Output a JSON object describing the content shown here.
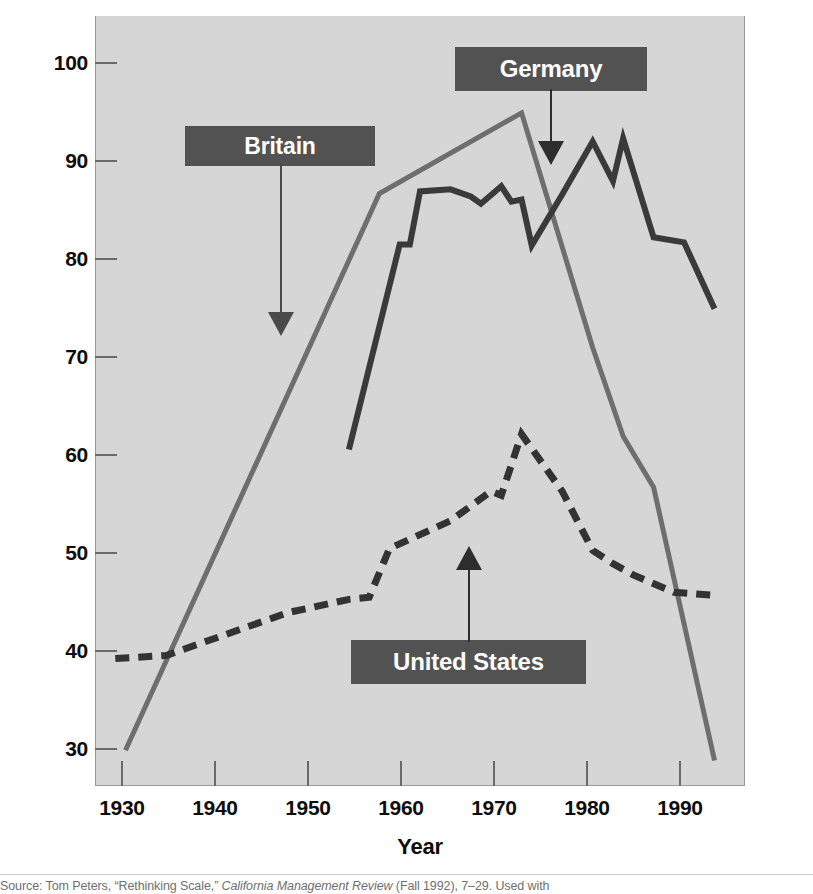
{
  "chart_data": {
    "type": "line",
    "title": "",
    "xlabel": "Year",
    "ylabel": "Number of employees per establishment (standardized)",
    "xlim": [
      1928,
      1992
    ],
    "ylim": [
      27.5,
      103
    ],
    "grid": false,
    "legend": "in-plot callout boxes with arrows",
    "xticks": [
      1930,
      1940,
      1950,
      1960,
      1970,
      1980,
      1990
    ],
    "yticks": [
      30,
      40,
      50,
      60,
      70,
      80,
      90,
      100
    ],
    "series": [
      {
        "name": "Britain",
        "style": "solid",
        "color": "#6e6e6e",
        "points": [
          [
            1931,
            31.0
          ],
          [
            1956,
            85.6
          ],
          [
            1970,
            93.5
          ],
          [
            1977,
            70.5
          ],
          [
            1980,
            61.8
          ],
          [
            1983,
            56.8
          ],
          [
            1989,
            30.0
          ]
        ]
      },
      {
        "name": "Germany",
        "style": "solid",
        "color": "#3a3a3a",
        "points": [
          [
            1953,
            60.5
          ],
          [
            1958,
            80.6
          ],
          [
            1959,
            80.6
          ],
          [
            1960,
            85.8
          ],
          [
            1963,
            86.0
          ],
          [
            1965,
            85.3
          ],
          [
            1966,
            84.6
          ],
          [
            1968,
            86.3
          ],
          [
            1969,
            84.8
          ],
          [
            1970,
            85.0
          ],
          [
            1971,
            80.5
          ],
          [
            1974,
            85.5
          ],
          [
            1977,
            90.7
          ],
          [
            1979,
            86.8
          ],
          [
            1980,
            91.0
          ],
          [
            1983,
            81.3
          ],
          [
            1986,
            80.8
          ],
          [
            1989,
            74.3
          ]
        ]
      },
      {
        "name": "United States",
        "style": "dashed",
        "color": "#333333",
        "points": [
          [
            1930,
            40.0
          ],
          [
            1935,
            40.3
          ],
          [
            1947,
            44.5
          ],
          [
            1953,
            45.8
          ],
          [
            1955,
            46.0
          ],
          [
            1957,
            50.8
          ],
          [
            1963,
            53.5
          ],
          [
            1967,
            56.4
          ],
          [
            1968,
            56.0
          ],
          [
            1970,
            62.0
          ],
          [
            1974,
            56.4
          ],
          [
            1977,
            50.6
          ],
          [
            1979,
            49.3
          ],
          [
            1981,
            48.2
          ],
          [
            1985,
            46.5
          ],
          [
            1989,
            46.2
          ]
        ]
      }
    ],
    "annotations": [
      {
        "label": "Britain",
        "box": {
          "x": 185,
          "y": 126,
          "w": 190,
          "h": 40
        },
        "arrow": {
          "from_x": 280,
          "from_y": 166,
          "to_x": 280,
          "to_y": 330
        },
        "points_at_series": "Britain"
      },
      {
        "label": "Germany",
        "box": {
          "x": 455,
          "y": 47,
          "w": 192,
          "h": 44
        },
        "arrow": {
          "from_x": 550,
          "from_y": 91,
          "to_x": 550,
          "to_y": 160
        },
        "points_at_series": "Germany"
      },
      {
        "label": "United States",
        "box": {
          "x": 351,
          "y": 640,
          "w": 235,
          "h": 44
        },
        "arrow": {
          "from_x": 469,
          "from_y": 640,
          "to_x": 469,
          "to_y": 548
        },
        "points_at_series": "United States"
      }
    ],
    "colors": {
      "plot_background": "#d6d6d6",
      "page_background": "#ffffff",
      "britain": "#6e6e6e",
      "germany": "#3a3a3a",
      "united_states": "#333333",
      "callout_box": "#525252",
      "callout_text": "#ffffff",
      "axis_text": "#0d0d0d"
    }
  },
  "axes": {
    "x_title": "Year",
    "y_title": "Number of employees per establishment (standardized)",
    "x_tick_labels": [
      "1930",
      "1940",
      "1950",
      "1960",
      "1970",
      "1980",
      "1990"
    ],
    "y_tick_labels": [
      "100",
      "90",
      "80",
      "70",
      "60",
      "50",
      "40",
      "30"
    ]
  },
  "callouts": {
    "britain": "Britain",
    "germany": "Germany",
    "united_states": "United States"
  },
  "source": {
    "prefix": "Source: Tom Peters, “Rethinking Scale,” ",
    "italic": "California Management Review",
    "suffix": " (Fall 1992), 7–29. Used with"
  }
}
